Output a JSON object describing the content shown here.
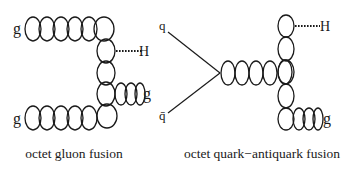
{
  "diagrams": [
    {
      "id": "octet-gluon-fusion",
      "caption": "octet gluon fusion",
      "labels": {
        "incoming_top": "g",
        "incoming_bottom": "g",
        "outgoing_higgs": "H",
        "outgoing_gluon": "g"
      }
    },
    {
      "id": "octet-quark-antiquark-fusion",
      "caption": "octet quark−antiquark fusion",
      "labels": {
        "incoming_quark": "q",
        "incoming_antiquark": "q̄",
        "outgoing_higgs": "H",
        "outgoing_gluon": "g"
      }
    }
  ],
  "colors": {
    "ink": "#1a1a1a",
    "background": "#ffffff"
  }
}
